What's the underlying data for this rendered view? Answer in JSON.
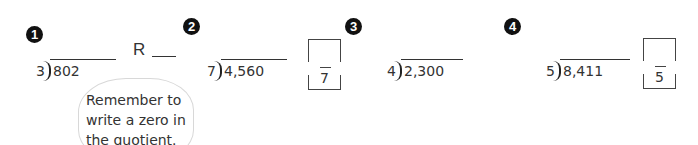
{
  "problems": [
    {
      "number": "1",
      "divisor": "3",
      "dividend": "802",
      "remainder_label": "R"
    },
    {
      "number": "2",
      "divisor": "7",
      "dividend": "4,560",
      "fraction_denominator": "7"
    },
    {
      "number": "3",
      "divisor": "4",
      "dividend": "2,300"
    },
    {
      "number": "4",
      "divisor": "5",
      "dividend": "8,411",
      "fraction_denominator": "5"
    }
  ],
  "hint": {
    "text": "Remember to write a zero in the quotient."
  }
}
